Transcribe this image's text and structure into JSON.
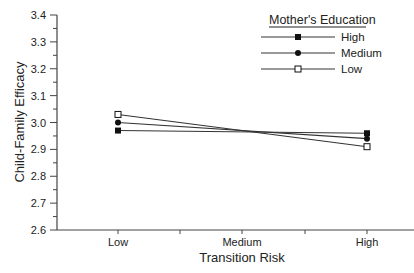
{
  "chart_data": {
    "type": "line",
    "title": "",
    "xlabel": "Transition Risk",
    "ylabel": "Child-Family Efficacy",
    "categories": [
      "Low",
      "Medium",
      "High"
    ],
    "ylim": [
      2.6,
      3.4
    ],
    "yticks": [
      "2.6",
      "2.7",
      "2.8",
      "2.9",
      "3.0",
      "3.1",
      "3.2",
      "3.3",
      "3.4"
    ],
    "grid": false,
    "legend_title": "Mother's Education",
    "legend_position": "upper right",
    "series": [
      {
        "name": "High",
        "marker": "filled-square",
        "x": [
          "Low",
          "High"
        ],
        "values": [
          2.97,
          2.96
        ]
      },
      {
        "name": "Medium",
        "marker": "filled-circle",
        "x": [
          "Low",
          "High"
        ],
        "values": [
          3.0,
          2.94
        ]
      },
      {
        "name": "Low",
        "marker": "open-square",
        "x": [
          "Low",
          "High"
        ],
        "values": [
          3.03,
          2.91
        ]
      }
    ]
  },
  "caption_fragment": "Figure 2.6 Mother's Education and Transition Risk"
}
